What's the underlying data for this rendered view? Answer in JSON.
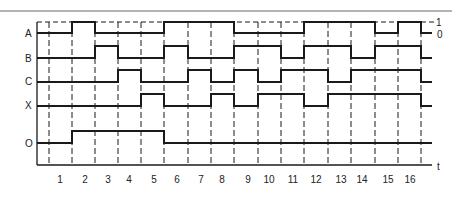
{
  "diagram": {
    "type": "timing-diagram",
    "top_rule_color": "#9a9a9a",
    "line_color": "#1a1a1a",
    "frame": {
      "left": 37,
      "top": 22,
      "bottom": 165,
      "right": 432
    },
    "time_boundaries_x": [
      49,
      72,
      95,
      118,
      141,
      164,
      188,
      211,
      234,
      258,
      281,
      304,
      328,
      351,
      375,
      398,
      421
    ],
    "time_labels": [
      {
        "text": "1",
        "x": 60
      },
      {
        "text": "2",
        "x": 85
      },
      {
        "text": "3",
        "x": 108
      },
      {
        "text": "4",
        "x": 129
      },
      {
        "text": "5",
        "x": 154
      },
      {
        "text": "6",
        "x": 177
      },
      {
        "text": "7",
        "x": 201
      },
      {
        "text": "8",
        "x": 222
      },
      {
        "text": "9",
        "x": 248
      },
      {
        "text": "10",
        "x": 269
      },
      {
        "text": "11",
        "x": 293
      },
      {
        "text": "12",
        "x": 316
      },
      {
        "text": "13",
        "x": 341
      },
      {
        "text": "14",
        "x": 362
      },
      {
        "text": "15",
        "x": 388
      },
      {
        "text": "16",
        "x": 410
      }
    ],
    "axis_label": "t",
    "level_labels": {
      "high": "1",
      "low": "0"
    },
    "signals": [
      {
        "name": "A",
        "label_y": 33,
        "high_y": 22,
        "low_y": 33,
        "segments": [
          [
            37,
            72,
            0
          ],
          [
            72,
            95,
            1
          ],
          [
            95,
            164,
            0
          ],
          [
            164,
            234,
            1
          ],
          [
            234,
            304,
            0
          ],
          [
            304,
            375,
            1
          ],
          [
            375,
            398,
            0
          ],
          [
            398,
            421,
            1
          ],
          [
            421,
            432,
            0
          ]
        ]
      },
      {
        "name": "B",
        "label_y": 58,
        "high_y": 46,
        "low_y": 58,
        "segments": [
          [
            37,
            95,
            0
          ],
          [
            95,
            118,
            1
          ],
          [
            118,
            164,
            0
          ],
          [
            164,
            188,
            1
          ],
          [
            188,
            234,
            0
          ],
          [
            234,
            281,
            1
          ],
          [
            281,
            304,
            0
          ],
          [
            304,
            351,
            1
          ],
          [
            351,
            375,
            0
          ],
          [
            375,
            421,
            1
          ],
          [
            421,
            432,
            0
          ]
        ]
      },
      {
        "name": "C",
        "label_y": 81,
        "high_y": 70,
        "low_y": 82,
        "segments": [
          [
            37,
            118,
            0
          ],
          [
            118,
            141,
            1
          ],
          [
            141,
            188,
            0
          ],
          [
            188,
            211,
            1
          ],
          [
            211,
            234,
            0
          ],
          [
            234,
            258,
            1
          ],
          [
            258,
            281,
            0
          ],
          [
            281,
            328,
            1
          ],
          [
            328,
            351,
            0
          ],
          [
            351,
            421,
            1
          ],
          [
            421,
            432,
            0
          ]
        ]
      },
      {
        "name": "X",
        "label_y": 105,
        "high_y": 94,
        "low_y": 106,
        "segments": [
          [
            37,
            141,
            0
          ],
          [
            141,
            164,
            1
          ],
          [
            164,
            211,
            0
          ],
          [
            211,
            234,
            1
          ],
          [
            234,
            258,
            0
          ],
          [
            258,
            304,
            1
          ],
          [
            304,
            328,
            0
          ],
          [
            328,
            421,
            1
          ],
          [
            421,
            432,
            0
          ]
        ]
      },
      {
        "name": "O",
        "label_y": 143,
        "high_y": 131,
        "low_y": 143,
        "segments": [
          [
            37,
            72,
            0
          ],
          [
            72,
            164,
            1
          ],
          [
            164,
            432,
            0
          ]
        ]
      }
    ]
  }
}
